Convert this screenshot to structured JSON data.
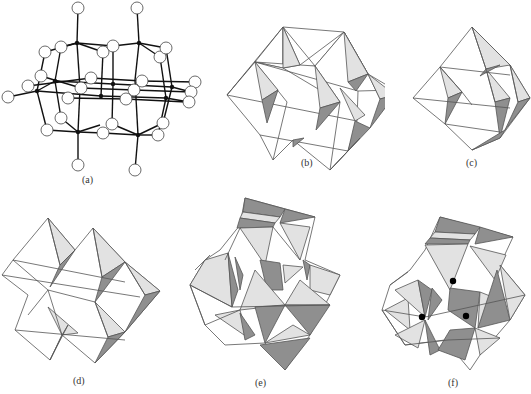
{
  "figure": {
    "panels": [
      {
        "id": "a",
        "label": "(a)",
        "kind": "ball-and-stick",
        "description": "Polyoxometalate cluster: metal atoms (small black) bonded to oxygen atoms (white circles)"
      },
      {
        "id": "b",
        "label": "(b)",
        "kind": "polyhedral",
        "description": "Octahedra sharing edges, 2x2 block"
      },
      {
        "id": "c",
        "label": "(c)",
        "kind": "polyhedral",
        "description": "Octahedral arrangement forming larger octahedron"
      },
      {
        "id": "d",
        "label": "(d)",
        "kind": "polyhedral",
        "description": "Edge-sharing octahedra, stepped arrangement"
      },
      {
        "id": "e",
        "label": "(e)",
        "kind": "polyhedral",
        "description": "Complex framework with light and dark shaded faces"
      },
      {
        "id": "f",
        "label": "(f)",
        "kind": "polyhedral",
        "description": "Framework with three highlighted black vertex dots"
      }
    ],
    "colors": {
      "background": "#ffffff",
      "edge": "#555555",
      "face_white": "#ffffff",
      "face_light": "#e2e2e2",
      "face_dark": "#8f8f8f",
      "metal_atom": "#111111",
      "oxygen_atom": "#ffffff",
      "highlight_dot": "#000000"
    }
  }
}
